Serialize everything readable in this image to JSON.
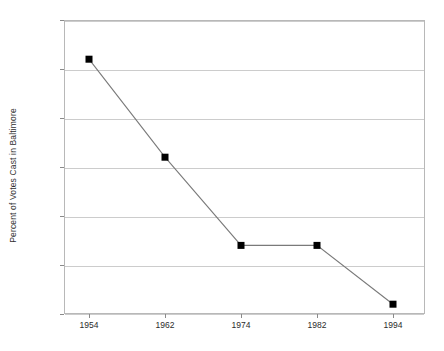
{
  "chart_data": {
    "type": "line",
    "title": "",
    "subtitle": "",
    "xlabel": "",
    "ylabel": "Percent of Votes Cast in Baltimore",
    "categories": [
      "1954",
      "1962",
      "1974",
      "1982",
      "1994"
    ],
    "x": [
      1954,
      1962,
      1974,
      1982,
      1994
    ],
    "values": [
      36,
      26,
      17,
      17,
      11
    ],
    "series": [
      {
        "name": "Percent of Votes Cast in Baltimore",
        "values": [
          36,
          26,
          17,
          17,
          11
        ]
      }
    ],
    "ylim": [
      10,
      40
    ],
    "ytick_labels": [
      "10",
      "15",
      "20",
      "25",
      "30",
      "35",
      "40"
    ],
    "ytick_values": [
      10,
      15,
      20,
      25,
      30,
      35,
      40
    ],
    "xtick_labels": [
      "1954",
      "1962",
      "1974",
      "1982",
      "1994"
    ],
    "grid": "horizontal",
    "legend": "none",
    "annotations": [],
    "colors": {
      "line": "#7a7a7a",
      "marker": "#000000",
      "grid": "#cccccc",
      "frame": "#b8b8b8",
      "text": "#2b2b2b",
      "background": "#ffffff"
    },
    "marker_style": "square"
  },
  "axis": {
    "y_title": "Percent of Votes Cast in Baltimore"
  }
}
